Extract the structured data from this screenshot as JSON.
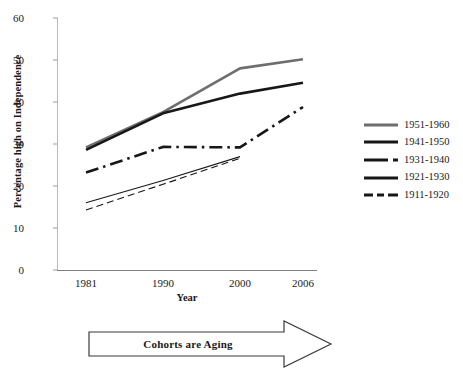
{
  "chart_data": {
    "type": "line",
    "title": "",
    "xlabel": "Year",
    "ylabel": "Percentage high on Independence",
    "x": [
      1981,
      1990,
      2000,
      2006
    ],
    "xtick_labels": [
      "1981",
      "1990",
      "2000",
      "2006"
    ],
    "ytick_labels": [
      "0",
      "10",
      "20",
      "30",
      "40",
      "50",
      "60"
    ],
    "yticks": [
      0,
      10,
      20,
      30,
      40,
      50,
      60
    ],
    "ylim": [
      0,
      60
    ],
    "grid": false,
    "legend_position": "right",
    "annotation": "Cohorts are Aging",
    "series": [
      {
        "name": "1951-1960",
        "x": [
          1981,
          1990,
          2000,
          2006
        ],
        "values": [
          29.2,
          37.6,
          48.0,
          50.2
        ],
        "color": "#6e6e6e",
        "style": "solid",
        "width": 2.6
      },
      {
        "name": "1941-1950",
        "x": [
          1981,
          1990,
          2000,
          2006
        ],
        "values": [
          28.6,
          37.3,
          42.0,
          44.6
        ],
        "color": "#171717",
        "style": "solid",
        "width": 2.6
      },
      {
        "name": "1931-1940",
        "x": [
          1981,
          1990,
          2000,
          2006
        ],
        "values": [
          23.2,
          29.3,
          29.2,
          38.8
        ],
        "color": "#171717",
        "style": "dash-dot",
        "width": 2.6
      },
      {
        "name": "1921-1930",
        "x": [
          1981,
          1990,
          2000
        ],
        "values": [
          16.0,
          21.3,
          27.0
        ],
        "color": "#171717",
        "style": "solid",
        "width": 1.1
      },
      {
        "name": "1911-1920",
        "x": [
          1981,
          1990,
          2000
        ],
        "values": [
          14.3,
          20.4,
          26.6
        ],
        "color": "#171717",
        "style": "dashed",
        "width": 1.1
      }
    ]
  },
  "axis": {
    "y_label": "Percentage high on Independence",
    "x_label": "Year",
    "y_ticks": [
      "60",
      "50",
      "40",
      "30",
      "20",
      "10",
      "0"
    ],
    "x_ticks": [
      "1981",
      "1990",
      "2000",
      "2006"
    ]
  },
  "legend": {
    "items": [
      {
        "label": "1951-1960"
      },
      {
        "label": "1941-1950"
      },
      {
        "label": "1931-1940"
      },
      {
        "label": "1921-1930"
      },
      {
        "label": "1911-1920"
      }
    ]
  },
  "annotation": {
    "arrow_label": "Cohorts are Aging"
  }
}
